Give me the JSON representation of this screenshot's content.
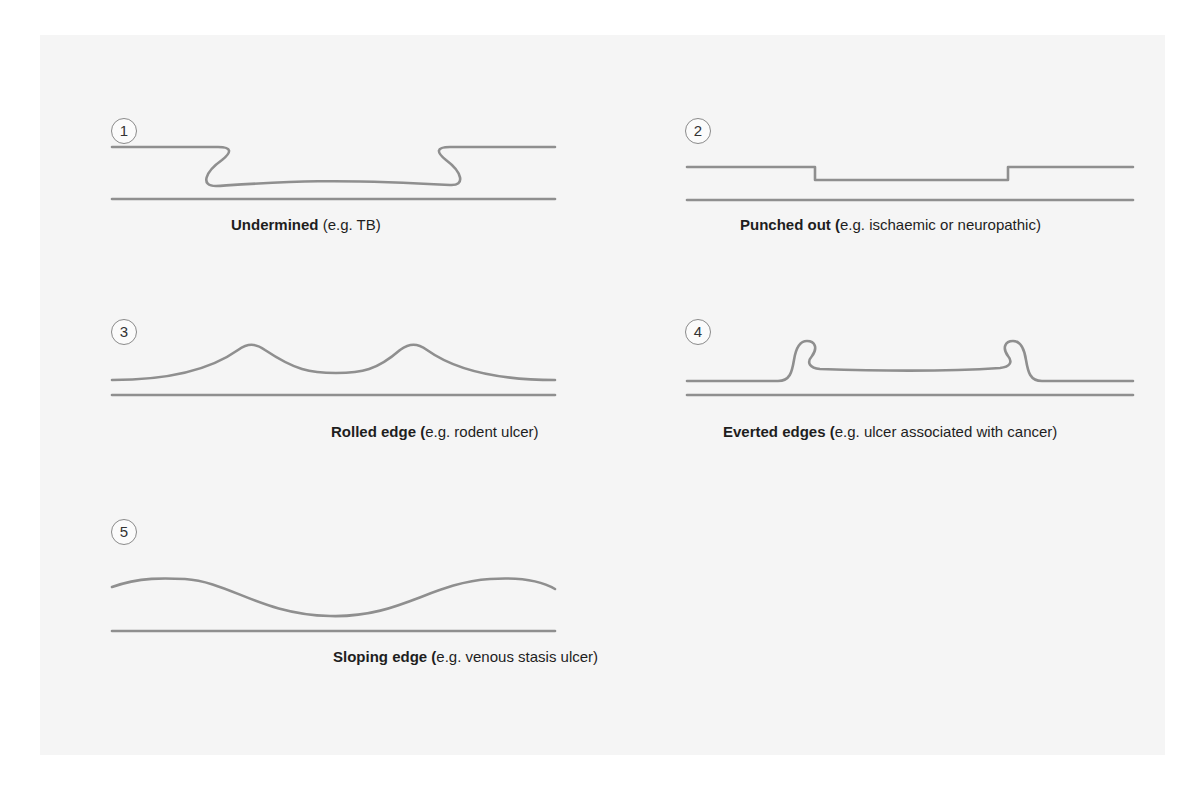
{
  "figures": [
    {
      "number": "1",
      "title": "Undermined",
      "detail": "(e.g. TB)",
      "shape": "undermined"
    },
    {
      "number": "2",
      "title": "Punched out (",
      "detail": "e.g. ischaemic or neuropathic)",
      "shape": "punched-out"
    },
    {
      "number": "3",
      "title": "Rolled edge (",
      "detail": "e.g. rodent ulcer)",
      "shape": "rolled-edge"
    },
    {
      "number": "4",
      "title": "Everted edges (",
      "detail": "e.g. ulcer associated with cancer)",
      "shape": "everted-edges"
    },
    {
      "number": "5",
      "title": "Sloping edge (",
      "detail": "e.g. venous stasis ulcer)",
      "shape": "sloping-edge"
    }
  ],
  "colors": {
    "line": "#8f8f8f",
    "panel_background": "#f5f5f5",
    "text": "#1e1e1e"
  }
}
